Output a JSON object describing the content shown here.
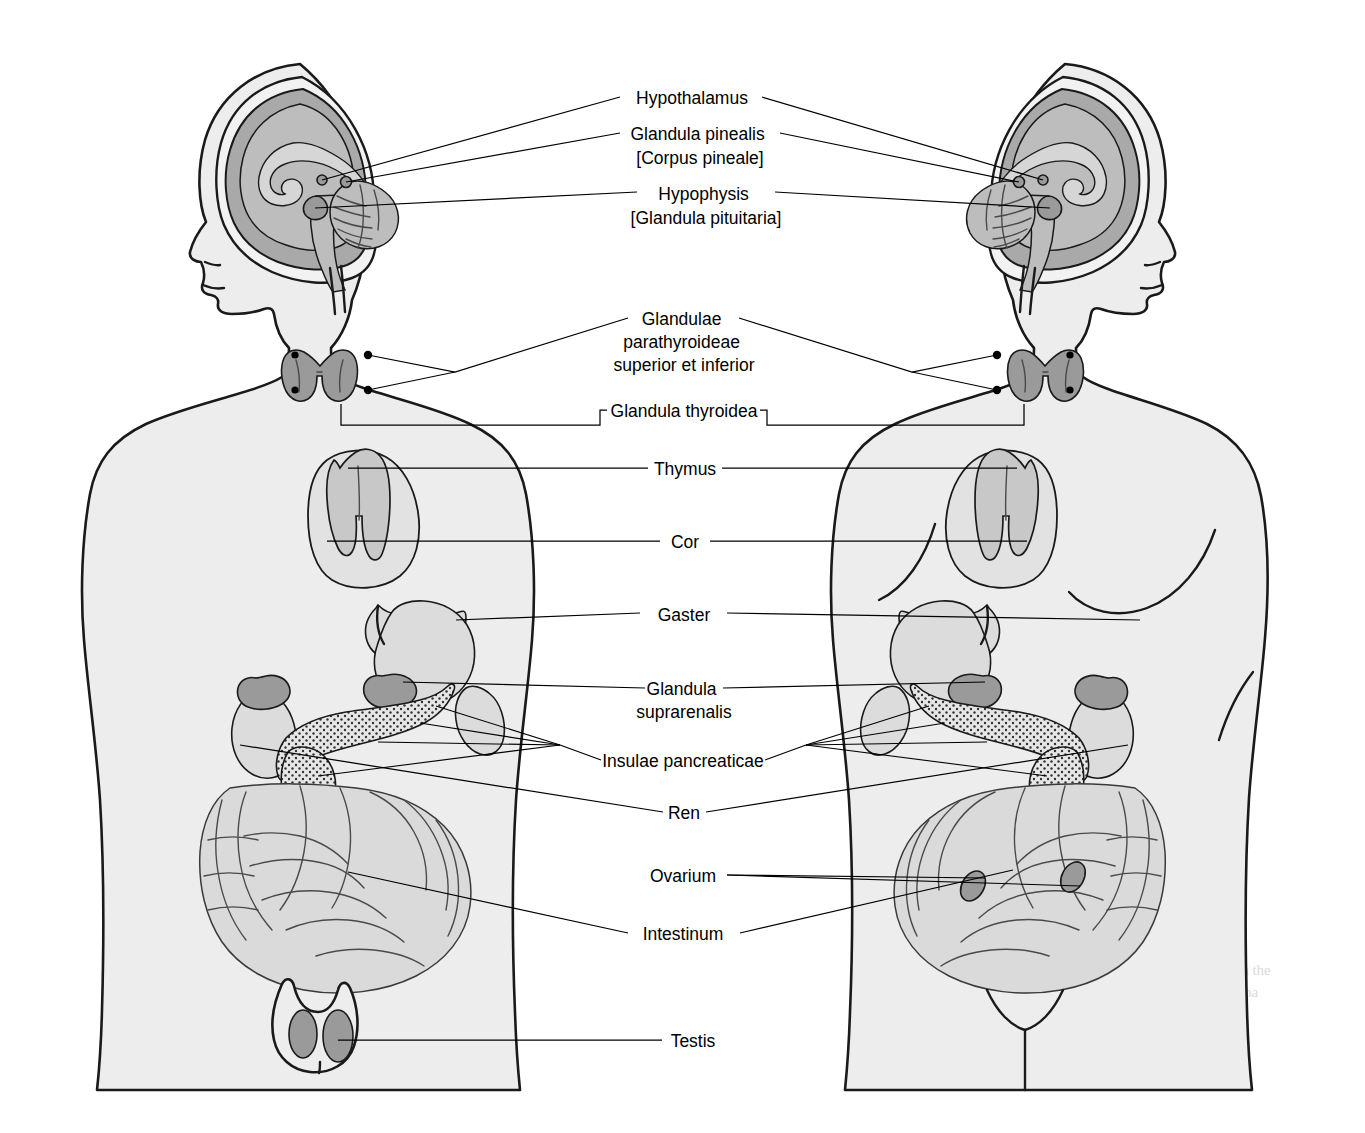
{
  "figure": {
    "subject_left": "male figure",
    "subject_right": "female figure",
    "style": "grayscale medical illustration",
    "background_color": "#ffffff"
  },
  "labels": [
    {
      "id": "hypothalamus",
      "lines": [
        "Hypothalamus"
      ],
      "y": 97,
      "organ": "hypothalamus"
    },
    {
      "id": "pineal",
      "lines": [
        "Glandula pinealis",
        "[Corpus pineale]"
      ],
      "y": 138,
      "organ": "pineal gland"
    },
    {
      "id": "hypophysis",
      "lines": [
        "Hypophysis",
        "[Glandula pituitaria]"
      ],
      "y": 194,
      "organ": "pituitary gland"
    },
    {
      "id": "parathyroid",
      "lines": [
        "Glandulae",
        "parathyroideae",
        "superior et inferior"
      ],
      "y": 320,
      "organ": "parathyroid glands"
    },
    {
      "id": "thyroid",
      "lines": [
        "Glandula thyroidea"
      ],
      "y": 410,
      "organ": "thyroid gland"
    },
    {
      "id": "thymus",
      "lines": [
        "Thymus"
      ],
      "y": 473,
      "organ": "thymus"
    },
    {
      "id": "cor",
      "lines": [
        "Cor"
      ],
      "y": 544,
      "organ": "heart"
    },
    {
      "id": "gaster",
      "lines": [
        "Gaster"
      ],
      "y": 618,
      "organ": "stomach"
    },
    {
      "id": "suprarenalis",
      "lines": [
        "Glandula",
        "suprarenalis"
      ],
      "y": 690,
      "organ": "adrenal gland"
    },
    {
      "id": "insulae",
      "lines": [
        "Insulae pancreaticae"
      ],
      "y": 762,
      "organ": "pancreatic islets"
    },
    {
      "id": "ren",
      "lines": [
        "Ren"
      ],
      "y": 818,
      "organ": "kidney"
    },
    {
      "id": "ovarium",
      "lines": [
        "Ovarium"
      ],
      "y": 880,
      "organ": "ovary"
    },
    {
      "id": "intestinum",
      "lines": [
        "Intestinum"
      ],
      "y": 938,
      "organ": "intestine"
    },
    {
      "id": "testis",
      "lines": [
        "Testis"
      ],
      "y": 1040,
      "organ": "testicle"
    }
  ],
  "colors": {
    "outline": "#1a1a1a",
    "body_fill": "#ededed",
    "brain_gray": "#a9a9a9",
    "brain_mid": "#bdbdbd",
    "organ_mid": "#c8c8c8",
    "organ_dark": "#9a9a9a",
    "gut_gray": "#dadada",
    "label_text": "#000000"
  },
  "ghost_text": [
    "with the",
    "the pa",
    "ple"
  ]
}
